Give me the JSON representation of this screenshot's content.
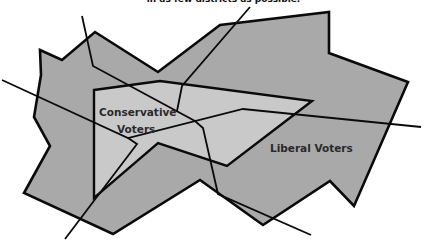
{
  "caption": "in as few districts as possible.",
  "colors": {
    "outer_region": "#a9a9a9",
    "inner_region": "#c9c9c9",
    "stroke": "#0a0a0a",
    "background": "#ffffff"
  },
  "regions": [
    {
      "name": "liberal-voters-region",
      "label": "Liberal Voters",
      "points": "40,50 62,60 95,32 158,72 220,25 329,12 329,53 408,82 354,206 330,181 263,225 200,180 113,234 24,193 50,146 34,117 41,75"
    },
    {
      "name": "conservative-voters-region",
      "label": "Conservative Voters",
      "points": "94,90 160,81 312,101 227,166 158,143 94,198"
    }
  ],
  "labels": {
    "conservative_line1": "Conservative",
    "conservative_line2": "Voters",
    "liberal": "Liberal Voters"
  },
  "district_lines": [
    {
      "name": "district-line-west",
      "points": "2,80 128,138 243,109 421,127"
    },
    {
      "name": "district-line-southwest",
      "points": "65,239 137,144 128,138"
    },
    {
      "name": "district-line-north-center",
      "points": "82,16 93,66 195,121 203,128 218,194 311,235"
    },
    {
      "name": "district-line-north-east",
      "points": "250,7 182,86 177,111"
    }
  ]
}
